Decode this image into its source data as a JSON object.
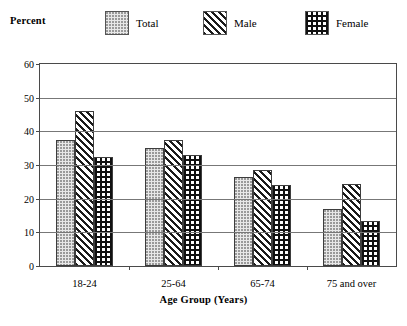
{
  "chart_data": {
    "type": "bar",
    "title": "",
    "xlabel": "Age Group (Years)",
    "ylabel": "Percent",
    "ylim": [
      0,
      60
    ],
    "yticks": [
      0,
      10,
      20,
      30,
      40,
      50,
      60
    ],
    "grid": true,
    "legend_position": "top",
    "categories": [
      "18-24",
      "25-64",
      "65-74",
      "75 and over"
    ],
    "series": [
      {
        "name": "Total",
        "pattern": "dots",
        "values": [
          37.5,
          35.0,
          26.5,
          17.0
        ]
      },
      {
        "name": "Male",
        "pattern": "diagonal",
        "values": [
          46.0,
          37.5,
          28.5,
          24.5
        ]
      },
      {
        "name": "Female",
        "pattern": "crosshatch",
        "values": [
          32.5,
          33.0,
          24.0,
          13.5
        ]
      }
    ]
  },
  "axis": {
    "unit_label": "Percent",
    "y_tick_labels": [
      "60",
      "50",
      "40",
      "30",
      "20",
      "10",
      "0"
    ],
    "x_tick_labels": [
      "18-24",
      "25-64",
      "65-74",
      "75 and over"
    ],
    "x_title": "Age Group (Years)"
  },
  "legend": {
    "entries": [
      {
        "label": "Total"
      },
      {
        "label": "Male"
      },
      {
        "label": "Female"
      }
    ]
  },
  "colors": {
    "frame": "#4a4a4a",
    "gridline": "#777777",
    "bar_outline": "#3d3d3d",
    "total_fill": "#e8e8e8",
    "male_fill": "#1a1a1a",
    "female_fill": "#111111",
    "background": "#ffffff"
  }
}
